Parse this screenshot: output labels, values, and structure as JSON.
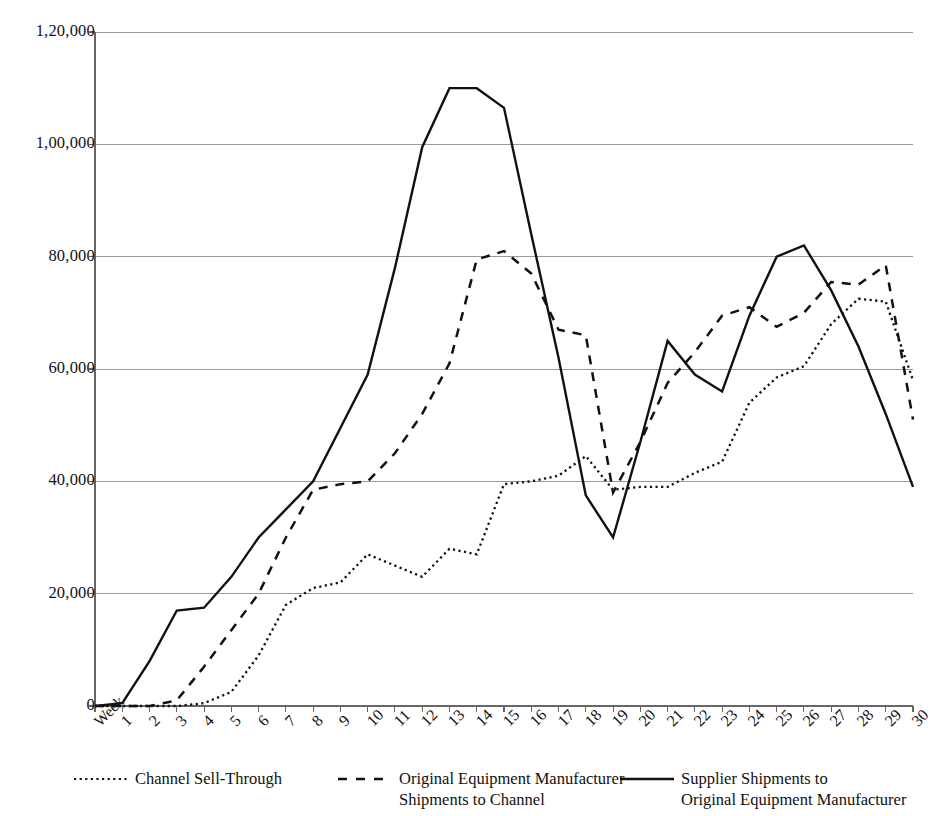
{
  "chart_data": {
    "type": "line",
    "title": "",
    "xlabel": "",
    "ylabel": "",
    "ylim": [
      0,
      120000
    ],
    "yticks": [
      0,
      20000,
      40000,
      60000,
      80000,
      100000,
      120000
    ],
    "ytick_labels": [
      "0",
      "20,000",
      "40,000",
      "60,000",
      "80,000",
      "1,00,000",
      "1,20,000"
    ],
    "grid": true,
    "legend_position": "bottom",
    "x_axis_prefix_label": "Week",
    "categories": [
      "Week",
      "1",
      "2",
      "3",
      "4",
      "5",
      "6",
      "7",
      "8",
      "9",
      "10",
      "11",
      "12",
      "13",
      "14",
      "15",
      "16",
      "17",
      "18",
      "19",
      "20",
      "21",
      "22",
      "23",
      "24",
      "25",
      "26",
      "27",
      "28",
      "29",
      "30"
    ],
    "x": [
      0,
      1,
      2,
      3,
      4,
      5,
      6,
      7,
      8,
      9,
      10,
      11,
      12,
      13,
      14,
      15,
      16,
      17,
      18,
      19,
      20,
      21,
      22,
      23,
      24,
      25,
      26,
      27,
      28,
      29,
      30
    ],
    "series": [
      {
        "name": "Channel Sell-Through",
        "style": "dotted",
        "color": "#111111",
        "values": [
          0,
          0,
          0,
          0,
          500,
          2500,
          9000,
          18000,
          21000,
          22000,
          27000,
          25000,
          23000,
          28000,
          27000,
          39500,
          40000,
          41000,
          44500,
          38500,
          39000,
          39000,
          41500,
          43500,
          54000,
          58500,
          60500,
          68000,
          72500,
          72000,
          58000
        ]
      },
      {
        "name": "Original Equipment Manufacturer\nShipments to Channel",
        "style": "dashed",
        "color": "#111111",
        "values": [
          0,
          0,
          0,
          1000,
          7000,
          13500,
          20000,
          30000,
          38500,
          39500,
          40000,
          45000,
          52000,
          61000,
          79500,
          81000,
          77000,
          67000,
          66000,
          38000,
          47000,
          57500,
          63000,
          69500,
          71000,
          67500,
          70000,
          75500,
          75000,
          78500,
          51000
        ]
      },
      {
        "name": "Supplier Shipments to\nOriginal Equipment Manufacturer",
        "style": "solid",
        "color": "#111111",
        "values": [
          0,
          500,
          8000,
          17000,
          17500,
          23000,
          30000,
          35000,
          40000,
          49500,
          59000,
          78000,
          99500,
          110000,
          110000,
          106500,
          84000,
          62000,
          37500,
          30000,
          47000,
          65000,
          59000,
          56000,
          69500,
          80000,
          82000,
          74000,
          64000,
          52000,
          39000
        ]
      }
    ]
  },
  "legend": {
    "items": [
      {
        "label": "Channel Sell-Through",
        "style": "dotted"
      },
      {
        "label": "Original Equipment Manufacturer\nShipments to Channel",
        "style": "dashed"
      },
      {
        "label": "Supplier Shipments to\nOriginal Equipment Manufacturer",
        "style": "solid"
      }
    ]
  },
  "colors": {
    "line": "#111111",
    "grid": "#9a9a9a",
    "axis": "#666666",
    "background": "#ffffff"
  }
}
